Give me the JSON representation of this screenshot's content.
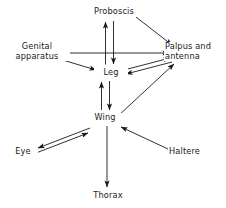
{
  "figure": {
    "type": "directed-graph-diagram",
    "background_color": "#ffffff",
    "line_color": "#1a1a1a",
    "text_color": "#1a1a1a",
    "width": 226,
    "height": 208
  },
  "nodes": [
    {
      "id": "proboscis",
      "label": "Proboscis",
      "x": 110,
      "y": 12,
      "align": "center"
    },
    {
      "id": "genital",
      "label": "Genital\napparatus",
      "x": 36,
      "y": 52,
      "align": "center"
    },
    {
      "id": "palpus",
      "label": "Palpus and\nantenna",
      "x": 194,
      "y": 52,
      "align": "center"
    },
    {
      "id": "leg",
      "label": "Leg",
      "x": 110,
      "y": 73,
      "align": "center"
    },
    {
      "id": "wing",
      "label": "Wing",
      "x": 104,
      "y": 118,
      "align": "center"
    },
    {
      "id": "eye",
      "label": "Eye",
      "x": 22,
      "y": 152,
      "align": "center"
    },
    {
      "id": "haltere",
      "label": "Haltere",
      "x": 187,
      "y": 152,
      "align": "center"
    },
    {
      "id": "thorax",
      "label": "Thorax",
      "x": 107,
      "y": 196,
      "align": "center"
    }
  ],
  "edges": [
    {
      "id": "leg-to-proboscis",
      "from": "leg",
      "to": "proboscis",
      "direction": "one-way",
      "style": "straight"
    },
    {
      "id": "proboscis-to-leg",
      "from": "proboscis",
      "to": "leg",
      "direction": "one-way",
      "style": "straight"
    },
    {
      "id": "proboscis-to-palpus",
      "from": "proboscis",
      "to": "palpus",
      "direction": "one-way",
      "style": "straight"
    },
    {
      "id": "genital-to-palpus",
      "from": "genital",
      "to": "palpus",
      "direction": "one-way",
      "style": "straight"
    },
    {
      "id": "genital-to-leg",
      "from": "genital",
      "to": "leg",
      "direction": "one-way",
      "style": "straight"
    },
    {
      "id": "leg-to-palpus",
      "from": "leg",
      "to": "palpus",
      "direction": "one-way",
      "style": "straight"
    },
    {
      "id": "palpus-to-leg",
      "from": "palpus",
      "to": "leg",
      "direction": "one-way",
      "style": "straight"
    },
    {
      "id": "wing-to-palpus",
      "from": "wing",
      "to": "palpus",
      "direction": "one-way",
      "style": "straight"
    },
    {
      "id": "leg-to-wing",
      "from": "leg",
      "to": "wing",
      "direction": "one-way",
      "style": "straight"
    },
    {
      "id": "wing-to-leg",
      "from": "wing",
      "to": "leg",
      "direction": "one-way",
      "style": "straight"
    },
    {
      "id": "wing-to-eye",
      "from": "wing",
      "to": "eye",
      "direction": "one-way",
      "style": "straight"
    },
    {
      "id": "eye-to-wing",
      "from": "eye",
      "to": "wing",
      "direction": "one-way",
      "style": "straight"
    },
    {
      "id": "haltere-to-wing",
      "from": "haltere",
      "to": "wing",
      "direction": "one-way",
      "style": "straight"
    },
    {
      "id": "wing-to-thorax",
      "from": "wing",
      "to": "thorax",
      "direction": "one-way",
      "style": "straight"
    }
  ]
}
